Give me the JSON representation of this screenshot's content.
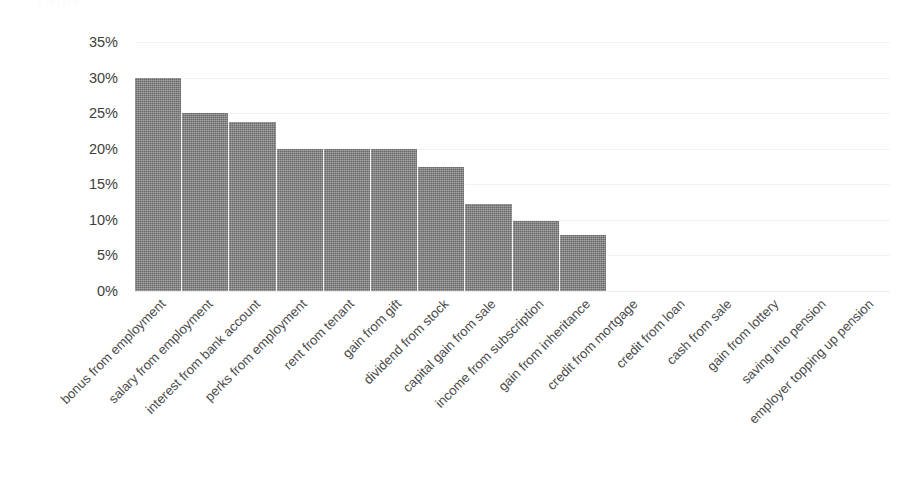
{
  "page": {
    "clipped_header_text": "ENTRY"
  },
  "chart_data": {
    "type": "bar",
    "title": "",
    "xlabel": "",
    "ylabel": "",
    "ylim": [
      0,
      0.35
    ],
    "ytick_labels": [
      "35%",
      "30%",
      "25%",
      "20%",
      "15%",
      "10%",
      "5%",
      "0%"
    ],
    "ytick_values": [
      35,
      30,
      25,
      20,
      15,
      10,
      5,
      0
    ],
    "grid": true,
    "legend": "none",
    "value_suffix": "%",
    "categories": [
      "bonus from employment",
      "salary from employment",
      "interest from bank account",
      "perks from employment",
      "rent from tenant",
      "gain from gift",
      "dividend from stock",
      "capital gain from sale",
      "income from subscription",
      "gain from inheritance",
      "credit from mortgage",
      "credit from loan",
      "cash from sale",
      "gain from lottery",
      "saving into pension",
      "employer topping up pension"
    ],
    "values": [
      30,
      25,
      23.8,
      20,
      20,
      20,
      17.5,
      12.3,
      9.9,
      7.9,
      0,
      0,
      0,
      0,
      0,
      0
    ],
    "bar_color": "#808080",
    "grid_color": "#f2f2f3",
    "text_color": "#404040"
  }
}
